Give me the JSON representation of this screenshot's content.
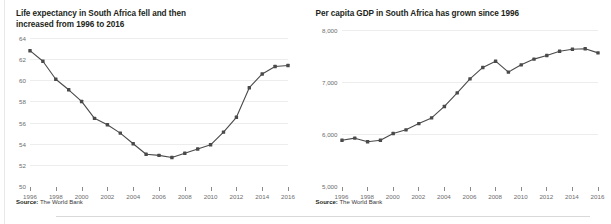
{
  "figure": {
    "accent_color": "#4a4a4a",
    "grid_color": "#ededed",
    "text_color": "#231f20",
    "axis_label_color": "#6d6d6d"
  },
  "panels": [
    {
      "name": "life-expectancy",
      "title": "Life expectancy in South Africa fell and then\nincreased from 1996 to 2016",
      "source_label": "Source:",
      "source_text": " The World Bank",
      "chart_data": {
        "type": "line",
        "title": "Life expectancy in South Africa fell and then increased from 1996 to 2016",
        "xlabel": "",
        "ylabel": "",
        "xlim": [
          1996,
          2016
        ],
        "ylim": [
          50,
          64
        ],
        "yticks": [
          50,
          52,
          54,
          56,
          58,
          60,
          62,
          64
        ],
        "ytick_labels": [
          "50",
          "52",
          "54",
          "56",
          "58",
          "60",
          "62",
          "64"
        ],
        "xticks": [
          1996,
          1998,
          2000,
          2002,
          2004,
          2006,
          2008,
          2010,
          2012,
          2014,
          2016
        ],
        "xtick_labels": [
          "1996",
          "1998",
          "2000",
          "2002",
          "2004",
          "2006",
          "2008",
          "2010",
          "2012",
          "2014",
          "2016"
        ],
        "grid": true,
        "legend": "none",
        "markers": "square",
        "x": [
          1996,
          1997,
          1998,
          1999,
          2000,
          2001,
          2002,
          2003,
          2004,
          2005,
          2006,
          2007,
          2008,
          2009,
          2010,
          2011,
          2012,
          2013,
          2014,
          2015,
          2016
        ],
        "values": [
          62.8,
          61.8,
          60.1,
          59.1,
          58.0,
          56.4,
          55.8,
          55.0,
          54.0,
          53.0,
          52.9,
          52.7,
          53.1,
          53.5,
          53.9,
          55.1,
          56.5,
          59.3,
          60.6,
          61.3,
          61.4
        ]
      }
    },
    {
      "name": "per-capita-gdp",
      "title": "Per capita GDP in South Africa has grown since 1996",
      "source_label": "Source:",
      "source_text": " The World Bank",
      "chart_data": {
        "type": "line",
        "title": "Per capita GDP in South Africa has grown since 1996",
        "xlabel": "",
        "ylabel": "",
        "xlim": [
          1996,
          2016
        ],
        "ylim": [
          5000,
          8000
        ],
        "yticks": [
          5000,
          6000,
          7000,
          8000
        ],
        "ytick_labels": [
          "5,000",
          "6,000",
          "7,000",
          "8,000"
        ],
        "xticks": [
          1996,
          1998,
          2000,
          2002,
          2004,
          2006,
          2008,
          2010,
          2012,
          2014,
          2016
        ],
        "xtick_labels": [
          "1996",
          "1998",
          "2000",
          "2002",
          "2004",
          "2006",
          "2008",
          "2010",
          "2012",
          "2014",
          "2016"
        ],
        "grid": true,
        "legend": "none",
        "markers": "square",
        "x": [
          1996,
          1997,
          1998,
          1999,
          2000,
          2001,
          2002,
          2003,
          2004,
          2005,
          2006,
          2007,
          2008,
          2009,
          2010,
          2011,
          2012,
          2013,
          2014,
          2015,
          2016
        ],
        "values": [
          5880,
          5920,
          5850,
          5880,
          6010,
          6080,
          6200,
          6310,
          6530,
          6790,
          7060,
          7280,
          7400,
          7190,
          7330,
          7440,
          7510,
          7590,
          7630,
          7640,
          7560
        ]
      }
    }
  ]
}
